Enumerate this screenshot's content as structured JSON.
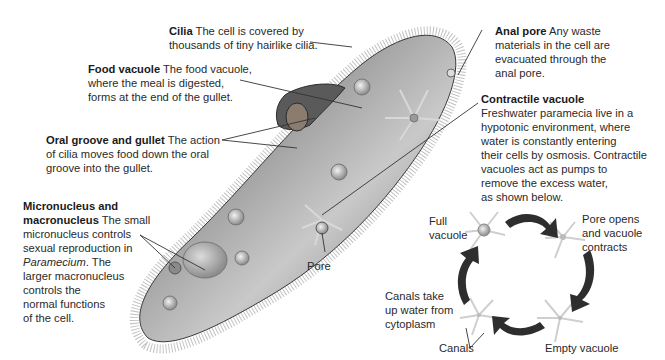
{
  "labels": {
    "cilia": {
      "title": "Cilia",
      "text": "The cell is covered by thousands of tiny hairlike cilia.",
      "line1_rest": "The cell is covered by",
      "line2": "thousands of tiny hairlike cilia."
    },
    "food_vacuole": {
      "title": "Food vacuole",
      "line1_rest": "The food vacuole,",
      "line2": "where the meal is digested,",
      "line3": "forms at the end of the gullet."
    },
    "oral_groove": {
      "title": "Oral groove and gullet",
      "line1_rest": "The action",
      "line2": "of cilia moves food down the oral",
      "line3": "groove into the gullet."
    },
    "nucleus": {
      "title_line1": "Micronucleus and",
      "title_line2": "macronucleus",
      "line2_rest": "The small",
      "line3": "micronucleus controls",
      "line4": "sexual reproduction in",
      "line5_italic": "Paramecium",
      "line5_rest": ". The",
      "line6": "larger macronucleus",
      "line7": "controls the",
      "line8": "normal functions",
      "line9": "of the cell."
    },
    "anal_pore": {
      "title": "Anal pore",
      "line1_rest": "Any waste",
      "line2": "materials in the cell are",
      "line3": "evacuated through the",
      "line4": "anal pore."
    },
    "contractile_vacuole": {
      "title": "Contractile vacuole",
      "line1": "Freshwater paramecia live in a",
      "line2": "hypotonic environment, where",
      "line3": "water is constantly entering",
      "line4": "their cells by osmosis. Contractile",
      "line5": "vacuoles act as pumps to",
      "line6": "remove the excess water,",
      "line7": "as shown below."
    },
    "pore": "Pore"
  },
  "cycle": {
    "full_vacuole": [
      "Full",
      "vacuole"
    ],
    "pore_opens": [
      "Pore opens",
      "and vacuole",
      "contracts"
    ],
    "empty_vacuole": "Empty vacuole",
    "canals_take_up": [
      "Canals take",
      "up water from",
      "cytoplasm"
    ],
    "canals": "Canals"
  },
  "colors": {
    "text": "#2a2a2a",
    "leader_line": "#333333",
    "cell_dark": "#3a3a3a",
    "cell_light": "#d8d8d8",
    "arrow": "#2e2e2e"
  }
}
